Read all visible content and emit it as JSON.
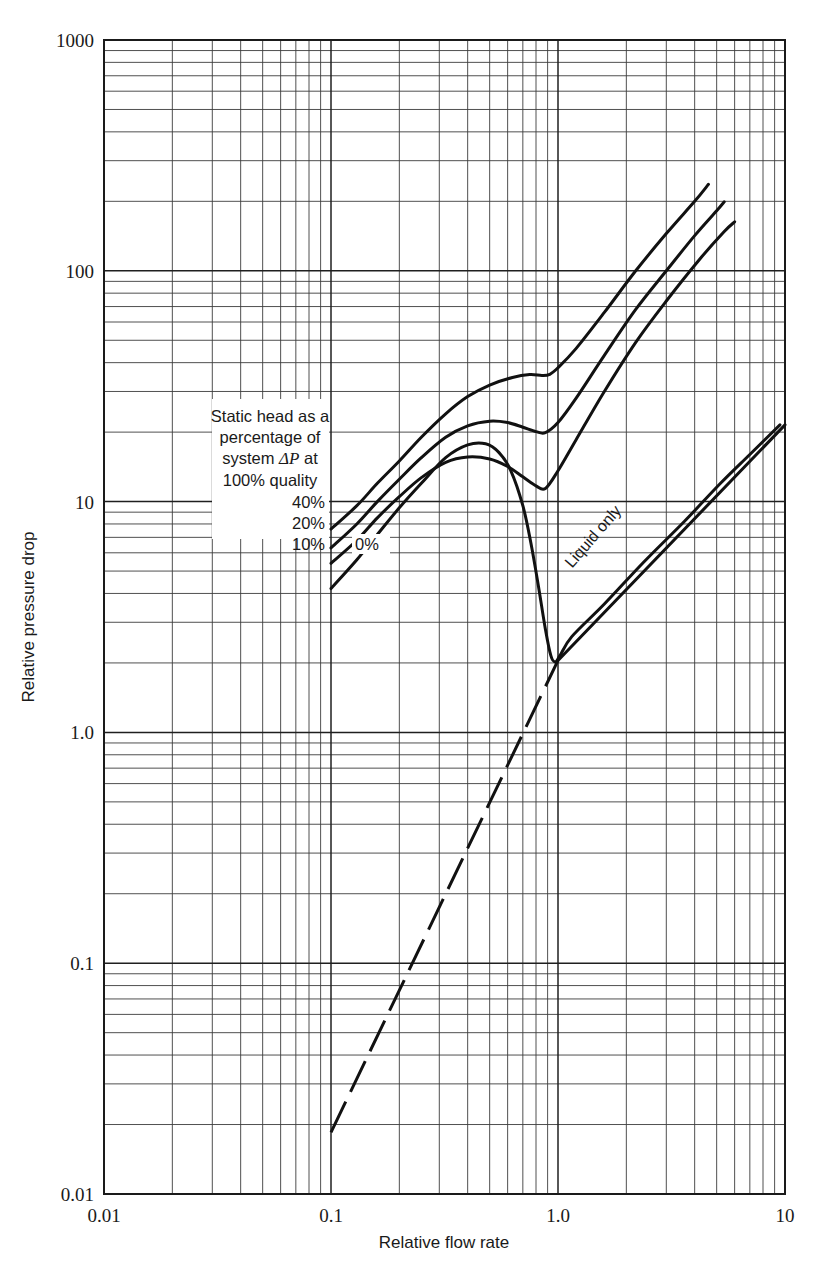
{
  "chart_data": {
    "type": "line",
    "title": "",
    "xlabel": "Relative flow rate",
    "ylabel": "Relative pressure drop",
    "xscale": "log",
    "yscale": "log",
    "xlim": [
      0.01,
      10
    ],
    "ylim": [
      0.01,
      1000
    ],
    "xticks": [
      "0.01",
      "0.1",
      "1.0",
      "10"
    ],
    "yticks": [
      "0.01",
      "0.1",
      "1.0",
      "10",
      "100",
      "1000"
    ],
    "grid": "log-log minor grid on both axes",
    "legend_position": "inside upper-left annotation box",
    "annotation": "Static head as a percentage of system ΔP at 100% quality",
    "series": [
      {
        "name": "40%",
        "label": "40%",
        "points": [
          [
            0.1,
            7.6
          ],
          [
            0.13,
            9.6
          ],
          [
            0.16,
            12.0
          ],
          [
            0.2,
            15.0
          ],
          [
            0.25,
            19.0
          ],
          [
            0.32,
            24.0
          ],
          [
            0.4,
            28.5
          ],
          [
            0.5,
            32.0
          ],
          [
            0.63,
            34.5
          ],
          [
            0.75,
            35.5
          ],
          [
            0.85,
            35.2
          ],
          [
            0.92,
            35.6
          ],
          [
            1.0,
            38.0
          ],
          [
            1.2,
            46.0
          ],
          [
            1.6,
            66.0
          ],
          [
            2.2,
            100.0
          ],
          [
            3.0,
            145.0
          ],
          [
            4.0,
            200.0
          ],
          [
            4.6,
            237.0
          ]
        ]
      },
      {
        "name": "20%",
        "label": "20%",
        "points": [
          [
            0.1,
            6.3
          ],
          [
            0.13,
            8.0
          ],
          [
            0.16,
            10.0
          ],
          [
            0.2,
            12.5
          ],
          [
            0.25,
            15.5
          ],
          [
            0.32,
            19.0
          ],
          [
            0.4,
            21.3
          ],
          [
            0.5,
            22.3
          ],
          [
            0.6,
            22.0
          ],
          [
            0.7,
            21.0
          ],
          [
            0.8,
            20.1
          ],
          [
            0.88,
            19.9
          ],
          [
            1.0,
            22.0
          ],
          [
            1.2,
            28.0
          ],
          [
            1.6,
            43.0
          ],
          [
            2.2,
            68.0
          ],
          [
            3.0,
            100.0
          ],
          [
            4.0,
            142.0
          ],
          [
            5.0,
            182.0
          ],
          [
            5.4,
            199.0
          ]
        ]
      },
      {
        "name": "10%",
        "label": "10%",
        "points": [
          [
            0.1,
            5.4
          ],
          [
            0.13,
            6.8
          ],
          [
            0.16,
            8.5
          ],
          [
            0.2,
            10.5
          ],
          [
            0.25,
            12.7
          ],
          [
            0.32,
            14.8
          ],
          [
            0.4,
            15.6
          ],
          [
            0.5,
            15.3
          ],
          [
            0.6,
            14.2
          ],
          [
            0.7,
            12.8
          ],
          [
            0.8,
            11.7
          ],
          [
            0.88,
            11.4
          ],
          [
            1.0,
            13.6
          ],
          [
            1.2,
            18.5
          ],
          [
            1.6,
            30.0
          ],
          [
            2.2,
            49.0
          ],
          [
            3.0,
            74.0
          ],
          [
            4.2,
            112.0
          ],
          [
            5.4,
            148.0
          ],
          [
            6.0,
            163.0
          ]
        ]
      },
      {
        "name": "0%",
        "label": "0%",
        "points": [
          [
            0.1,
            4.2
          ],
          [
            0.13,
            5.6
          ],
          [
            0.16,
            7.2
          ],
          [
            0.2,
            9.4
          ],
          [
            0.25,
            12.0
          ],
          [
            0.32,
            15.5
          ],
          [
            0.4,
            17.6
          ],
          [
            0.48,
            17.8
          ],
          [
            0.55,
            16.3
          ],
          [
            0.62,
            13.6
          ],
          [
            0.7,
            9.6
          ],
          [
            0.76,
            6.6
          ],
          [
            0.82,
            4.3
          ],
          [
            0.88,
            2.8
          ],
          [
            0.93,
            2.15
          ],
          [
            0.97,
            2.02
          ],
          [
            1.02,
            2.15
          ],
          [
            1.15,
            2.6
          ],
          [
            1.6,
            3.6
          ],
          [
            2.4,
            5.5
          ],
          [
            3.6,
            8.2
          ],
          [
            5.2,
            12.0
          ],
          [
            7.0,
            16.0
          ],
          [
            9.5,
            21.5
          ]
        ]
      },
      {
        "name": "Liquid only",
        "label": "Liquid only",
        "style": "dashed extrapolation below merge point",
        "points": [
          [
            0.1,
            0.0185
          ],
          [
            1.0,
            2.05
          ],
          [
            10.0,
            21.5
          ]
        ]
      }
    ]
  },
  "axes": {
    "y_title": "Relative pressure drop",
    "x_title": "Relative flow rate",
    "y_tick_labels": [
      "1000",
      "100",
      "10",
      "1.0",
      "0.1",
      "0.01"
    ],
    "x_tick_labels": [
      "0.01",
      "0.1",
      "1.0",
      "10"
    ]
  },
  "annotation_box": {
    "line1": "Static head as a",
    "line2": "percentage of",
    "line3_pre": "system ",
    "line3_sym": "ΔP",
    "line3_post": " at",
    "line4": "100% quality",
    "label_40": "40%",
    "label_20": "20%",
    "label_10": "10%",
    "label_0": "0%"
  },
  "inline_labels": {
    "liquid_only": "Liquid only"
  },
  "colors": {
    "curve": "#111111",
    "grid_minor": "#3c3c3c",
    "grid_major": "#1f1f1f",
    "frame": "#1a1a1a",
    "background": "#ffffff",
    "text": "#1a1a1a"
  }
}
